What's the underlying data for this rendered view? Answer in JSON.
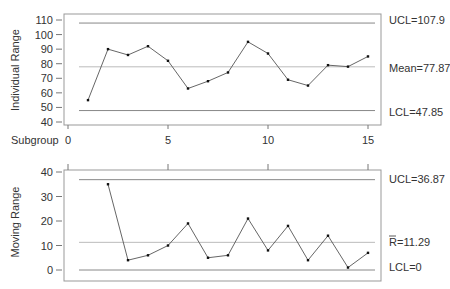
{
  "chart_data": [
    {
      "type": "line",
      "title": "",
      "xlabel": "Subgroup",
      "ylabel": "Individual Range",
      "x": [
        1,
        2,
        3,
        4,
        5,
        6,
        7,
        8,
        9,
        10,
        11,
        12,
        13,
        14,
        15
      ],
      "values": [
        55,
        90,
        86,
        92,
        82,
        63,
        68,
        74,
        95,
        87,
        69,
        65,
        79,
        78,
        85
      ],
      "ylim": [
        40,
        110
      ],
      "xlim": [
        0,
        15
      ],
      "yticks": [
        40,
        50,
        60,
        70,
        80,
        90,
        100,
        110
      ],
      "xticks": [
        0,
        5,
        10,
        15
      ],
      "control_lines": {
        "ucl": {
          "value": 107.9,
          "label": "UCL=107.9"
        },
        "center": {
          "value": 77.87,
          "label": "Mean=77.87"
        },
        "lcl": {
          "value": 47.85,
          "label": "LCL=47.85"
        }
      },
      "grid": false,
      "legend": "none"
    },
    {
      "type": "line",
      "title": "",
      "xlabel": "",
      "ylabel": "Moving Range",
      "x": [
        2,
        3,
        4,
        5,
        6,
        7,
        8,
        9,
        10,
        11,
        12,
        13,
        14,
        15
      ],
      "values": [
        35,
        4,
        6,
        10,
        19,
        5,
        6,
        21,
        8,
        18,
        4,
        14,
        1,
        7
      ],
      "ylim": [
        0,
        40
      ],
      "xlim": [
        0,
        15
      ],
      "yticks": [
        0,
        10,
        20,
        30,
        40
      ],
      "xticks": [
        0,
        5,
        10,
        15
      ],
      "control_lines": {
        "ucl": {
          "value": 36.87,
          "label": "UCL=36.87"
        },
        "center": {
          "value": 11.29,
          "label": "R̄=11.29"
        },
        "lcl": {
          "value": 0,
          "label": "LCL=0"
        }
      },
      "grid": false,
      "legend": "none"
    }
  ],
  "labels": {
    "top_ylabel": "Individual Range",
    "bottom_ylabel": "Moving Range",
    "subgroup": "Subgroup",
    "top_ucl": "UCL=107.9",
    "top_mean": "Mean=77.87",
    "top_lcl": "LCL=47.85",
    "bottom_ucl": "UCL=36.87",
    "bottom_rbar_value": "=11.29",
    "bottom_rbar_symbol": "R",
    "bottom_lcl": "LCL=0"
  },
  "colors": {
    "line": "#555555",
    "point": "#111111",
    "control": "#888888",
    "center": "#bbbbbb",
    "frame": "#999999"
  }
}
